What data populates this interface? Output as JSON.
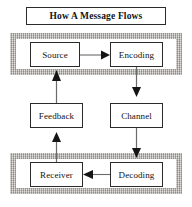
{
  "diagram": {
    "title": "How A Message Flows",
    "type": "flowchart",
    "nodes": [
      {
        "id": "source",
        "label": "Source",
        "row": "top",
        "column": "left"
      },
      {
        "id": "encoding",
        "label": "Encoding",
        "row": "top",
        "column": "right"
      },
      {
        "id": "feedback",
        "label": "Feedback",
        "row": "middle",
        "column": "left"
      },
      {
        "id": "channel",
        "label": "Channel",
        "row": "middle",
        "column": "right"
      },
      {
        "id": "receiver",
        "label": "Receiver",
        "row": "bottom",
        "column": "left"
      },
      {
        "id": "decoding",
        "label": "Decoding",
        "row": "bottom",
        "column": "right"
      }
    ],
    "edges": [
      {
        "from": "source",
        "to": "encoding",
        "direction": "right"
      },
      {
        "from": "encoding",
        "to": "channel",
        "direction": "down"
      },
      {
        "from": "channel",
        "to": "decoding",
        "direction": "down"
      },
      {
        "from": "decoding",
        "to": "receiver",
        "direction": "left"
      },
      {
        "from": "receiver",
        "to": "feedback",
        "direction": "up"
      },
      {
        "from": "feedback",
        "to": "source",
        "direction": "up"
      }
    ],
    "bands": [
      {
        "id": "top",
        "contains": [
          "source",
          "encoding"
        ]
      },
      {
        "id": "bottom",
        "contains": [
          "receiver",
          "decoding"
        ]
      }
    ],
    "colors": {
      "band_fill": "#b5b2ad",
      "box_border": "#2b2b2b",
      "box_fill": "#ffffff",
      "text": "#121212",
      "arrow": "#6b6b6b",
      "arrowhead": "#151515",
      "background": "#ffffff"
    }
  }
}
